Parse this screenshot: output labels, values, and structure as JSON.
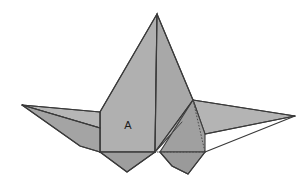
{
  "figure": {
    "background_color": "#ffffff",
    "labels": [
      {
        "text": "A",
        "x": 128,
        "y": 126
      }
    ],
    "colors": {
      "facet_light": "#bdbdbd",
      "facet_mid": "#b0b0b0",
      "facet_base": "#a8a8a8",
      "facet_dark": "#9a9a9a",
      "facet_darker": "#8e8e8e",
      "edge_stroke": "#3d3d3d",
      "hidden_stroke": "#4d4d4d",
      "label_color": "#1c1c1c"
    },
    "geometry": {
      "apex": {
        "x": 157,
        "y": 14
      },
      "center_vertex": {
        "x": 155,
        "y": 152
      },
      "left_wing_tip": {
        "x": 22,
        "y": 105
      },
      "right_wing_tip": {
        "x": 295,
        "y": 116
      },
      "left_body_corner": {
        "x": 100,
        "y": 112
      },
      "right_body_corner": {
        "x": 193,
        "y": 100
      },
      "left_flap_tip": {
        "x": 127,
        "y": 172
      },
      "right_flap_tip": {
        "x": 188,
        "y": 174
      }
    },
    "facets": [
      {
        "name": "body-left-panel",
        "fill": "#b0b0b0",
        "points": "157,14 155,152 100,152 100,112"
      },
      {
        "name": "body-right-panel",
        "fill": "#a8a8a8",
        "points": "157,14 193,100 182,122 155,152"
      },
      {
        "name": "body-right-lower-wedge",
        "fill": "#b4b4b4",
        "points": "193,100 182,122 155,152"
      },
      {
        "name": "left-wing-upper",
        "fill": "#b6b6b6",
        "points": "22,105 100,112 100,128"
      },
      {
        "name": "left-wing-lower",
        "fill": "#a4a4a4",
        "points": "22,105 100,128 100,152 80,146"
      },
      {
        "name": "right-wing-upper",
        "fill": "#b4b4b4",
        "points": "193,100 295,116 205,134"
      },
      {
        "name": "right-wing-lower",
        "fill": "#a0a0a0",
        "points": "193,100 205,134 205,152 160,152"
      },
      {
        "name": "left-bottom-flap",
        "fill": "#9e9e9e",
        "points": "100,152 155,152 127,172"
      },
      {
        "name": "right-bottom-flap",
        "fill": "#9a9a9a",
        "points": "160,152 205,152 188,174 172,166"
      }
    ],
    "creases": [
      {
        "name": "center-spine",
        "d": "M157,14 L155,152"
      },
      {
        "name": "left-body-fold",
        "d": "M100,112 L100,152"
      },
      {
        "name": "left-body-top-edge",
        "d": "M157,14 L100,112"
      },
      {
        "name": "right-body-edge",
        "d": "M157,14 L193,100"
      },
      {
        "name": "right-inner-fold",
        "d": "M193,100 L155,152"
      },
      {
        "name": "right-wedge-fold",
        "d": "M182,122 L155,152"
      },
      {
        "name": "left-wing-crease",
        "d": "M22,105 L100,128"
      },
      {
        "name": "right-wing-crease",
        "d": "M295,116 L205,134"
      },
      {
        "name": "left-wing-top-edge",
        "d": "M22,105 L100,112"
      },
      {
        "name": "left-wing-bottom-edge",
        "d": "M22,105 L80,146 L100,152"
      },
      {
        "name": "right-wing-top-edge",
        "d": "M193,100 L295,116"
      },
      {
        "name": "right-wing-bottom-edge",
        "d": "M295,116 L205,152"
      },
      {
        "name": "base-line-left",
        "d": "M100,152 L155,152"
      },
      {
        "name": "left-flap-edge",
        "d": "M100,152 L127,172 L155,152"
      },
      {
        "name": "right-flap-edge",
        "d": "M160,152 L172,166 L188,174 L205,152"
      }
    ],
    "hidden_edges": [
      {
        "name": "hidden-vertical-fold",
        "d": "M193,100 L205,152"
      },
      {
        "name": "hidden-base-line",
        "d": "M157,152 L205,152"
      }
    ]
  }
}
